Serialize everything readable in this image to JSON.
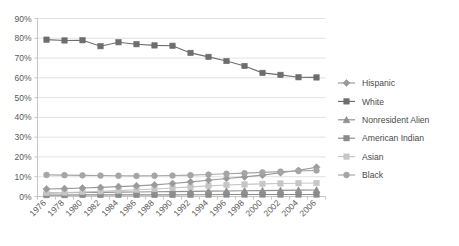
{
  "chart_data": {
    "type": "line",
    "title": "",
    "xlabel": "",
    "ylabel": "",
    "ylim": [
      0,
      90
    ],
    "grid": true,
    "legend_position": "right",
    "y_ticks": [
      "0%",
      "10%",
      "20%",
      "30%",
      "40%",
      "50%",
      "60%",
      "70%",
      "80%",
      "90%"
    ],
    "y_tick_values": [
      0,
      10,
      20,
      30,
      40,
      50,
      60,
      70,
      80,
      90
    ],
    "categories": [
      "1976",
      "1978",
      "1980",
      "1982",
      "1984",
      "1986",
      "1988",
      "1990",
      "1992",
      "1994",
      "1996",
      "1998",
      "2000",
      "2002",
      "2004",
      "2006"
    ],
    "series": [
      {
        "name": "Hispanic",
        "marker": "diamond",
        "color": "#9a9a9a",
        "values": [
          3.8,
          4.0,
          4.3,
          4.6,
          5.0,
          5.4,
          5.9,
          6.6,
          7.4,
          8.2,
          9.1,
          9.9,
          10.8,
          12.0,
          13.2,
          14.8
        ]
      },
      {
        "name": "White",
        "marker": "square",
        "color": "#6e6e6e",
        "values": [
          79.3,
          78.9,
          79.0,
          76.0,
          78.0,
          77.0,
          76.4,
          76.2,
          72.6,
          70.6,
          68.5,
          66.0,
          62.5,
          61.5,
          60.3,
          60.2
        ]
      },
      {
        "name": "Nonresident Alien",
        "marker": "triangle",
        "color": "#8f8f8f",
        "values": [
          1.8,
          1.9,
          2.0,
          2.1,
          2.2,
          2.3,
          2.4,
          2.5,
          2.6,
          2.7,
          2.8,
          2.9,
          3.0,
          3.1,
          3.2,
          3.3
        ]
      },
      {
        "name": "American Indian",
        "marker": "square",
        "color": "#8a8a8a",
        "values": [
          0.7,
          0.7,
          0.8,
          0.8,
          0.8,
          0.8,
          0.8,
          0.8,
          0.9,
          0.9,
          1.0,
          1.0,
          1.0,
          1.0,
          1.0,
          1.0
        ]
      },
      {
        "name": "Asian",
        "marker": "square-light",
        "color": "#c6c6c6",
        "values": [
          1.8,
          2.0,
          2.3,
          2.6,
          3.0,
          3.4,
          3.8,
          4.3,
          4.9,
          5.4,
          5.8,
          6.1,
          6.4,
          6.6,
          6.7,
          6.8
        ]
      },
      {
        "name": "Black",
        "marker": "circle",
        "color": "#a5a5a5",
        "values": [
          10.9,
          10.8,
          10.7,
          10.6,
          10.5,
          10.4,
          10.5,
          10.6,
          10.8,
          11.1,
          11.5,
          11.8,
          12.2,
          12.6,
          12.9,
          13.2
        ]
      }
    ]
  },
  "legend": {
    "items": [
      {
        "label": "Hispanic"
      },
      {
        "label": "White"
      },
      {
        "label": "Nonresident Alien"
      },
      {
        "label": "American Indian"
      },
      {
        "label": "Asian"
      },
      {
        "label": "Black"
      }
    ]
  }
}
